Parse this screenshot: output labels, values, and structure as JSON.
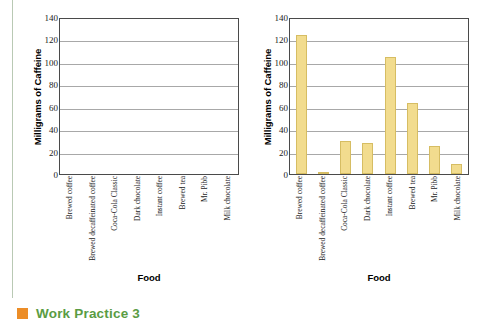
{
  "footer": {
    "label": "Work Practice 3",
    "bullet_color": "#ec8d27",
    "text_color": "#5a9c43"
  },
  "chart_data": [
    {
      "id": "left",
      "type": "bar",
      "title": "",
      "xlabel": "Food",
      "ylabel": "Milligrams of Caffeine",
      "ylim": [
        0,
        140
      ],
      "yticks": [
        0,
        20,
        40,
        60,
        80,
        100,
        120,
        140
      ],
      "grid": true,
      "legend": "none",
      "bar_color": "#f2dc8e",
      "categories": [
        "Brewed coffee",
        "Brewed decaffeinated coffee",
        "Coca-Cola Classic",
        "Dark chocolate",
        "Instant coffee",
        "Brewed tea",
        "Mr. Pibb",
        "Milk chocolate"
      ],
      "values": [
        null,
        null,
        null,
        null,
        null,
        null,
        null,
        null
      ]
    },
    {
      "id": "right",
      "type": "bar",
      "title": "",
      "xlabel": "Food",
      "ylabel": "Milligrams of Caffeine",
      "ylim": [
        0,
        140
      ],
      "yticks": [
        0,
        20,
        40,
        60,
        80,
        100,
        120,
        140
      ],
      "grid": true,
      "legend": "none",
      "bar_color": "#f2dc8e",
      "categories": [
        "Brewed coffee",
        "Brewed decaffeinated coffee",
        "Coca-Cola Classic",
        "Dark chocolate",
        "Instant coffee",
        "Brewed tea",
        "Mr. Pibb",
        "Milk chocolate"
      ],
      "values": [
        124,
        2,
        29,
        28,
        104,
        63,
        25,
        9
      ]
    }
  ]
}
